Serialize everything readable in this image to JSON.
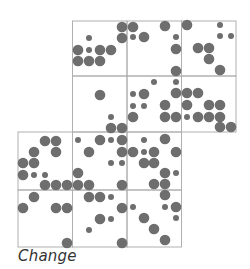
{
  "caption": "Change",
  "colors": {
    "grid": "#b0b0b0",
    "dot": "#6e6e6e",
    "background": "#ffffff"
  },
  "grid": {
    "xlines": [
      18,
      72.5,
      127,
      181.5,
      236
    ],
    "ylines": [
      21,
      76,
      132,
      190,
      247
    ],
    "cells": [
      {
        "row": 0,
        "col": 1
      },
      {
        "row": 0,
        "col": 2
      },
      {
        "row": 0,
        "col": 3
      },
      {
        "row": 1,
        "col": 1
      },
      {
        "row": 1,
        "col": 2
      },
      {
        "row": 1,
        "col": 3
      },
      {
        "row": 2,
        "col": 0
      },
      {
        "row": 2,
        "col": 1
      },
      {
        "row": 2,
        "col": 2
      },
      {
        "row": 3,
        "col": 0
      },
      {
        "row": 3,
        "col": 1
      },
      {
        "row": 3,
        "col": 2
      }
    ]
  },
  "dots": [
    [
      89,
      38,
      "s"
    ],
    [
      78,
      50,
      "b"
    ],
    [
      89,
      50,
      "s"
    ],
    [
      100,
      50,
      "b"
    ],
    [
      111,
      50,
      "b"
    ],
    [
      78,
      61,
      "b"
    ],
    [
      89,
      61,
      "b"
    ],
    [
      100,
      61,
      "b"
    ],
    [
      122,
      27,
      "b"
    ],
    [
      122,
      38,
      "b"
    ],
    [
      133,
      27,
      "b"
    ],
    [
      133,
      37,
      "s"
    ],
    [
      144,
      37,
      "b"
    ],
    [
      165,
      26,
      "b"
    ],
    [
      176,
      37,
      "s"
    ],
    [
      176,
      49,
      "b"
    ],
    [
      176,
      71,
      "b"
    ],
    [
      187,
      25,
      "b"
    ],
    [
      220,
      25,
      "s"
    ],
    [
      220,
      36,
      "s"
    ],
    [
      231,
      36,
      "s"
    ],
    [
      198,
      48,
      "b"
    ],
    [
      209,
      48,
      "b"
    ],
    [
      209,
      59,
      "b"
    ],
    [
      220,
      70,
      "b"
    ],
    [
      100,
      95,
      "b"
    ],
    [
      111,
      117,
      "s"
    ],
    [
      111,
      128,
      "b"
    ],
    [
      122,
      128,
      "b"
    ],
    [
      154,
      82,
      "s"
    ],
    [
      176,
      82,
      "s"
    ],
    [
      133,
      94,
      "s"
    ],
    [
      144,
      94,
      "b"
    ],
    [
      176,
      93,
      "b"
    ],
    [
      133,
      106,
      "s"
    ],
    [
      144,
      106,
      "s"
    ],
    [
      165,
      105,
      "b"
    ],
    [
      133,
      117,
      "b"
    ],
    [
      165,
      117,
      "b"
    ],
    [
      176,
      117,
      "b"
    ],
    [
      187,
      93,
      "b"
    ],
    [
      198,
      93,
      "b"
    ],
    [
      187,
      105,
      "b"
    ],
    [
      209,
      105,
      "b"
    ],
    [
      220,
      105,
      "b"
    ],
    [
      187,
      117,
      "s"
    ],
    [
      198,
      117,
      "b"
    ],
    [
      209,
      117,
      "b"
    ],
    [
      220,
      117,
      "b"
    ],
    [
      220,
      127,
      "b"
    ],
    [
      231,
      127,
      "b"
    ],
    [
      45,
      141,
      "b"
    ],
    [
      56,
      141,
      "b"
    ],
    [
      34,
      152,
      "b"
    ],
    [
      56,
      152,
      "b"
    ],
    [
      23,
      163,
      "b"
    ],
    [
      34,
      163,
      "b"
    ],
    [
      23,
      175,
      "b"
    ],
    [
      34,
      175,
      "s"
    ],
    [
      45,
      175,
      "s"
    ],
    [
      45,
      185,
      "b"
    ],
    [
      56,
      185,
      "b"
    ],
    [
      67,
      185,
      "b"
    ],
    [
      78,
      140,
      "s"
    ],
    [
      100,
      140,
      "b"
    ],
    [
      111,
      140,
      "s"
    ],
    [
      122,
      140,
      "b"
    ],
    [
      89,
      152,
      "b"
    ],
    [
      122,
      152,
      "b"
    ],
    [
      111,
      163,
      "s"
    ],
    [
      122,
      163,
      "s"
    ],
    [
      78,
      173,
      "b"
    ],
    [
      78,
      185,
      "b"
    ],
    [
      89,
      185,
      "b"
    ],
    [
      122,
      185,
      "b"
    ],
    [
      144,
      140,
      "s"
    ],
    [
      165,
      139,
      "b"
    ],
    [
      133,
      152,
      "b"
    ],
    [
      144,
      152,
      "s"
    ],
    [
      154,
      152,
      "b"
    ],
    [
      176,
      152,
      "b"
    ],
    [
      144,
      163,
      "b"
    ],
    [
      154,
      163,
      "b"
    ],
    [
      165,
      173,
      "b"
    ],
    [
      176,
      173,
      "s"
    ],
    [
      154,
      184,
      "b"
    ],
    [
      165,
      184,
      "b"
    ],
    [
      34,
      197,
      "b"
    ],
    [
      23,
      208,
      "b"
    ],
    [
      56,
      208,
      "b"
    ],
    [
      67,
      208,
      "b"
    ],
    [
      67,
      243,
      "b"
    ],
    [
      89,
      197,
      "b"
    ],
    [
      100,
      197,
      "b"
    ],
    [
      111,
      197,
      "s"
    ],
    [
      122,
      208,
      "b"
    ],
    [
      100,
      219,
      "b"
    ],
    [
      111,
      219,
      "s"
    ],
    [
      89,
      230,
      "s"
    ],
    [
      122,
      243,
      "b"
    ],
    [
      165,
      195,
      "b"
    ],
    [
      133,
      207,
      "s"
    ],
    [
      165,
      207,
      "s"
    ],
    [
      176,
      207,
      "b"
    ],
    [
      176,
      218,
      "s"
    ],
    [
      144,
      218,
      "b"
    ],
    [
      154,
      229,
      "b"
    ],
    [
      165,
      240,
      "b"
    ]
  ]
}
